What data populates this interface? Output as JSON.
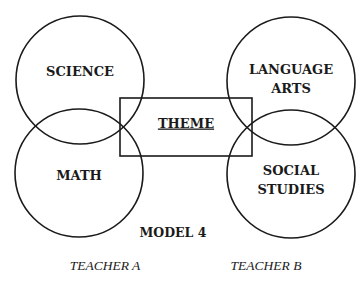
{
  "diagram": {
    "title": "MODEL 4",
    "center": {
      "label": "THEME",
      "shape": "rectangle",
      "underlined": true
    },
    "circles": [
      {
        "id": "science",
        "lines": [
          "SCIENCE"
        ],
        "group": "TEACHER A"
      },
      {
        "id": "math",
        "lines": [
          "MATH"
        ],
        "group": "TEACHER A"
      },
      {
        "id": "language-arts",
        "lines": [
          "LANGUAGE",
          "ARTS"
        ],
        "group": "TEACHER B"
      },
      {
        "id": "social-studies",
        "lines": [
          "SOCIAL",
          "STUDIES"
        ],
        "group": "TEACHER B"
      }
    ],
    "teachers": [
      {
        "label": "TEACHER A"
      },
      {
        "label": "TEACHER B"
      }
    ],
    "colors": {
      "stroke": "#1a1a1a",
      "background": "#ffffff"
    }
  }
}
